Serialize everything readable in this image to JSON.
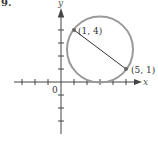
{
  "problem": {
    "number": "9."
  },
  "axes": {
    "x_label": "x",
    "y_label": "y",
    "origin_label": "0"
  },
  "points": [
    {
      "label": "(1, 4)",
      "x": 1,
      "y": 4
    },
    {
      "label": "(5, 1)",
      "x": 5,
      "y": 1
    }
  ],
  "circle": {
    "center": [
      3,
      2.5
    ],
    "radius": 2.5,
    "color": "#999999"
  },
  "segment": {
    "from": [
      1,
      4
    ],
    "to": [
      5,
      1
    ],
    "color": "#333333"
  },
  "ticks": {
    "x": [
      -3,
      -2,
      -1,
      1,
      2,
      3,
      4,
      5
    ],
    "y": [
      -3,
      -2,
      -1,
      1,
      2,
      3,
      4
    ]
  }
}
